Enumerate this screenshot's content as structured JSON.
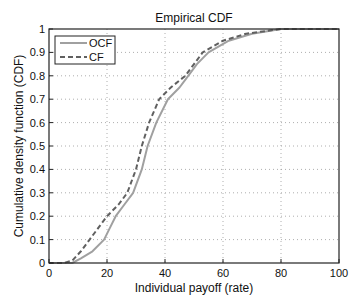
{
  "chart_data": {
    "type": "line",
    "title": "Empirical CDF",
    "xlabel": "Individual payoff (rate)",
    "ylabel": "Cumulative density function (CDF)",
    "xlim": [
      0,
      100
    ],
    "ylim": [
      0,
      1
    ],
    "xticks": [
      0,
      20,
      40,
      60,
      80,
      100
    ],
    "yticks": [
      0,
      0.1,
      0.2,
      0.3,
      0.4,
      0.5,
      0.6,
      0.7,
      0.8,
      0.9,
      1
    ],
    "grid": true,
    "legend_position": "upper-left",
    "series": [
      {
        "name": "OCF",
        "style": "solid",
        "color": "#a0a0a0",
        "x": [
          0,
          8,
          11,
          15,
          19,
          21,
          23,
          26,
          29,
          32,
          34,
          37,
          41,
          45,
          48,
          51,
          55,
          62,
          70,
          80,
          100
        ],
        "y": [
          0,
          0,
          0.02,
          0.05,
          0.1,
          0.15,
          0.2,
          0.25,
          0.3,
          0.4,
          0.5,
          0.6,
          0.7,
          0.75,
          0.8,
          0.85,
          0.9,
          0.95,
          0.98,
          1,
          1
        ]
      },
      {
        "name": "CF",
        "style": "dashed",
        "color": "#606060",
        "x": [
          0,
          5,
          8,
          11,
          14,
          17,
          20,
          24,
          27,
          30,
          32,
          34.5,
          38,
          42,
          47,
          50,
          53,
          60,
          68,
          80,
          100
        ],
        "y": [
          0,
          0,
          0.01,
          0.05,
          0.1,
          0.15,
          0.2,
          0.25,
          0.3,
          0.4,
          0.5,
          0.6,
          0.7,
          0.75,
          0.8,
          0.85,
          0.9,
          0.95,
          0.98,
          1,
          1
        ]
      }
    ]
  }
}
